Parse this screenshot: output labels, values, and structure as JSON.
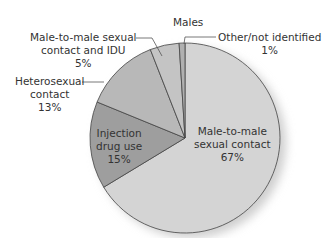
{
  "chart_data": {
    "type": "pie",
    "title": "Males",
    "slices": [
      {
        "label": "Male-to-male sexual contact",
        "value": 67,
        "color": "#d4d4d4"
      },
      {
        "label": "Injection drug use",
        "value": 15,
        "color": "#9e9e9e"
      },
      {
        "label": "Heterosexual contact",
        "value": 13,
        "color": "#b8b8b8"
      },
      {
        "label": "Male-to-male sexual contact and IDU",
        "value": 5,
        "color": "#c4c4c4"
      },
      {
        "label": "Other/not identified",
        "value": 1,
        "color": "#b0b0b0"
      }
    ]
  },
  "labels": {
    "title": "Males",
    "msm": [
      "Male-to-male",
      "sexual contact",
      "67%"
    ],
    "idu": [
      "Injection",
      "drug use",
      "15%"
    ],
    "hetero": [
      "Heterosexual",
      "contact",
      "13%"
    ],
    "msm_idu": [
      "Male-to-male sexual",
      "contact and IDU",
      "5%"
    ],
    "other": [
      "Other/not identified",
      "1%"
    ]
  }
}
